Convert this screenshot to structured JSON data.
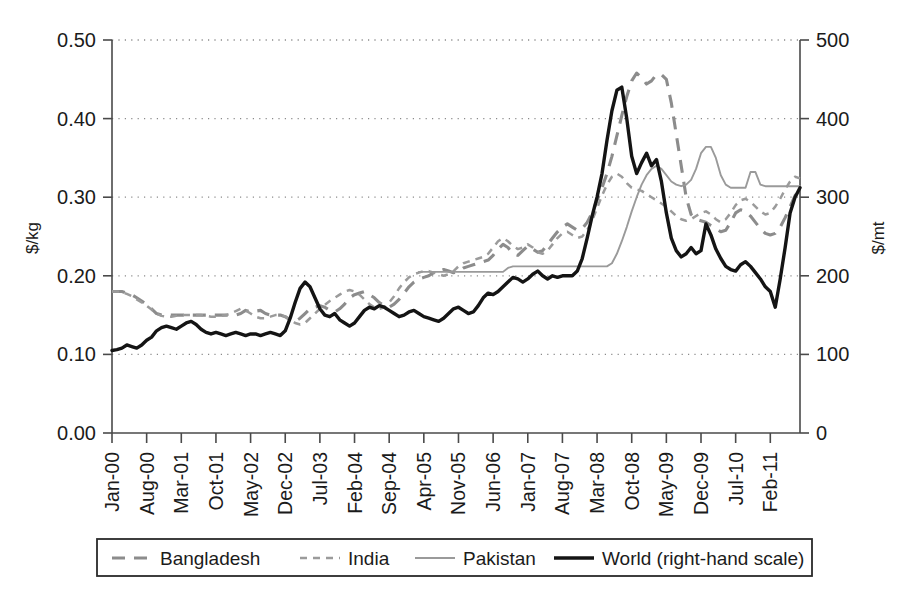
{
  "chart_data": {
    "type": "line",
    "title": "",
    "xlabel": "",
    "ylabel": "$/kg",
    "ylabel_right": "$/mt",
    "ylim": [
      0.0,
      0.5
    ],
    "ylim_right": [
      0,
      500
    ],
    "ytick_labels": [
      "0.50",
      "0.40",
      "0.30",
      "0.20",
      "0.10",
      "0.00"
    ],
    "ytick_values": [
      0.5,
      0.4,
      0.3,
      0.2,
      0.1,
      0.0
    ],
    "ytick_labels_right": [
      "500",
      "400",
      "300",
      "200",
      "100",
      "0"
    ],
    "ytick_values_right": [
      500,
      400,
      300,
      200,
      100,
      0
    ],
    "grid": "horizontal-dotted",
    "legend_position": "below-axes",
    "xtick_labels": [
      "Jan-00",
      "Aug-00",
      "Mar-01",
      "Oct-01",
      "May-02",
      "Dec-02",
      "Jul-03",
      "Feb-04",
      "Sep-04",
      "Apr-05",
      "Nov-05",
      "Jun-06",
      "Jan-07",
      "Aug-07",
      "Mar-08",
      "Oct-08",
      "May-09",
      "Dec-09",
      "Jul-10",
      "Feb-11"
    ],
    "xtick_index": [
      0,
      7,
      14,
      21,
      28,
      35,
      42,
      49,
      56,
      63,
      70,
      77,
      84,
      91,
      98,
      105,
      112,
      119,
      126,
      133
    ],
    "x_start": "Jan-00",
    "x_end": "Aug-11",
    "n_points": 140,
    "series": [
      {
        "name": "Bangladesh",
        "style": "long-dashed",
        "color": "#8c8c8c",
        "axis": "left",
        "unit": "$/kg",
        "start_index": 0,
        "values": [
          0.18,
          0.18,
          0.18,
          0.178,
          0.176,
          0.172,
          0.168,
          0.163,
          0.158,
          0.152,
          0.15,
          0.15,
          0.15,
          0.15,
          0.15,
          0.15,
          0.15,
          0.15,
          0.15,
          0.15,
          0.15,
          0.15,
          0.15,
          0.15,
          0.15,
          0.15,
          0.152,
          0.156,
          0.154,
          0.155,
          0.156,
          0.152,
          0.15,
          0.15,
          0.15,
          0.148,
          0.144,
          0.142,
          0.146,
          0.152,
          0.158,
          0.16,
          0.162,
          0.16,
          0.156,
          0.154,
          0.158,
          0.164,
          0.172,
          0.176,
          0.178,
          0.18,
          0.176,
          0.172,
          0.166,
          0.162,
          0.16,
          0.164,
          0.17,
          0.178,
          0.186,
          0.192,
          0.196,
          0.198,
          0.2,
          0.204,
          0.206,
          0.208,
          0.206,
          0.204,
          0.206,
          0.21,
          0.212,
          0.214,
          0.216,
          0.218,
          0.22,
          0.226,
          0.234,
          0.24,
          0.236,
          0.228,
          0.226,
          0.232,
          0.238,
          0.234,
          0.23,
          0.232,
          0.24,
          0.248,
          0.256,
          0.262,
          0.266,
          0.262,
          0.258,
          0.26,
          0.268,
          0.28,
          0.296,
          0.312,
          0.33,
          0.352,
          0.378,
          0.404,
          0.428,
          0.448,
          0.458,
          0.452,
          0.444,
          0.448,
          0.456,
          0.456,
          0.45,
          0.42,
          0.38,
          0.34,
          0.3,
          0.278,
          0.272,
          0.27,
          0.268,
          0.264,
          0.26,
          0.256,
          0.258,
          0.268,
          0.28,
          0.284,
          0.282,
          0.276,
          0.268,
          0.26,
          0.254,
          0.252,
          0.254,
          0.262,
          0.274,
          0.288,
          0.302,
          0.312,
          0.31,
          0.298,
          0.286,
          0.278
        ]
      },
      {
        "name": "India",
        "style": "short-dashed",
        "color": "#9b9b9b",
        "axis": "left",
        "unit": "$/kg",
        "start_index": 0,
        "values": [
          0.18,
          0.18,
          0.179,
          0.177,
          0.174,
          0.17,
          0.166,
          0.162,
          0.157,
          0.152,
          0.149,
          0.148,
          0.148,
          0.149,
          0.15,
          0.15,
          0.15,
          0.15,
          0.15,
          0.149,
          0.148,
          0.148,
          0.149,
          0.15,
          0.152,
          0.155,
          0.158,
          0.156,
          0.152,
          0.148,
          0.146,
          0.146,
          0.148,
          0.15,
          0.15,
          0.148,
          0.144,
          0.14,
          0.138,
          0.14,
          0.146,
          0.152,
          0.158,
          0.163,
          0.168,
          0.172,
          0.176,
          0.18,
          0.182,
          0.18,
          0.176,
          0.17,
          0.164,
          0.16,
          0.158,
          0.16,
          0.166,
          0.174,
          0.184,
          0.192,
          0.198,
          0.202,
          0.204,
          0.206,
          0.206,
          0.204,
          0.202,
          0.2,
          0.202,
          0.206,
          0.212,
          0.216,
          0.218,
          0.22,
          0.222,
          0.224,
          0.228,
          0.236,
          0.244,
          0.248,
          0.244,
          0.238,
          0.234,
          0.236,
          0.24,
          0.236,
          0.23,
          0.228,
          0.232,
          0.24,
          0.248,
          0.254,
          0.256,
          0.252,
          0.248,
          0.25,
          0.258,
          0.27,
          0.286,
          0.302,
          0.316,
          0.326,
          0.33,
          0.326,
          0.318,
          0.312,
          0.31,
          0.308,
          0.304,
          0.3,
          0.296,
          0.292,
          0.288,
          0.282,
          0.276,
          0.272,
          0.27,
          0.272,
          0.276,
          0.28,
          0.282,
          0.278,
          0.272,
          0.268,
          0.272,
          0.28,
          0.29,
          0.296,
          0.298,
          0.294,
          0.288,
          0.282,
          0.278,
          0.28,
          0.288,
          0.298,
          0.31,
          0.32,
          0.326,
          0.324,
          0.316,
          0.304,
          0.292,
          0.282
        ]
      },
      {
        "name": "Pakistan",
        "style": "thin-solid",
        "color": "#9a9a9a",
        "axis": "left",
        "unit": "$/kg",
        "start_index": 62,
        "values": [
          0.205,
          0.205,
          0.205,
          0.205,
          0.205,
          0.205,
          0.205,
          0.205,
          0.205,
          0.205,
          0.205,
          0.205,
          0.205,
          0.205,
          0.205,
          0.205,
          0.205,
          0.205,
          0.21,
          0.212,
          0.212,
          0.212,
          0.212,
          0.212,
          0.212,
          0.212,
          0.212,
          0.212,
          0.212,
          0.212,
          0.212,
          0.212,
          0.212,
          0.212,
          0.212,
          0.212,
          0.212,
          0.212,
          0.212,
          0.216,
          0.228,
          0.244,
          0.262,
          0.282,
          0.3,
          0.316,
          0.328,
          0.336,
          0.34,
          0.336,
          0.328,
          0.32,
          0.316,
          0.314,
          0.316,
          0.322,
          0.336,
          0.356,
          0.364,
          0.364,
          0.35,
          0.328,
          0.316,
          0.312,
          0.312,
          0.312,
          0.312,
          0.332,
          0.332,
          0.316,
          0.314,
          0.314,
          0.314,
          0.314,
          0.314,
          0.314,
          0.314,
          0.314,
          0.314,
          0.314,
          0.314,
          0.314,
          0.3,
          0.298,
          0.298,
          0.298,
          0.298,
          0.298,
          0.298,
          0.298,
          0.306,
          0.312,
          0.312,
          0.316,
          0.322,
          0.33,
          0.336,
          0.332,
          0.322,
          0.312
        ]
      },
      {
        "name": "World (right-hand scale)",
        "style": "thick-solid",
        "color": "#141414",
        "axis": "right",
        "unit": "$/mt",
        "start_index": 0,
        "values": [
          105,
          106,
          108,
          112,
          110,
          108,
          112,
          118,
          122,
          130,
          134,
          136,
          134,
          132,
          136,
          140,
          142,
          138,
          132,
          128,
          126,
          128,
          126,
          124,
          126,
          128,
          126,
          124,
          126,
          126,
          124,
          126,
          128,
          126,
          124,
          130,
          146,
          166,
          184,
          192,
          186,
          172,
          158,
          150,
          148,
          152,
          144,
          140,
          136,
          140,
          148,
          156,
          160,
          158,
          162,
          160,
          156,
          152,
          148,
          150,
          154,
          156,
          152,
          148,
          146,
          144,
          142,
          146,
          152,
          158,
          160,
          156,
          152,
          154,
          162,
          172,
          178,
          176,
          180,
          186,
          192,
          198,
          196,
          192,
          196,
          202,
          206,
          200,
          196,
          200,
          198,
          200,
          200,
          200,
          206,
          222,
          248,
          276,
          300,
          330,
          372,
          410,
          436,
          440,
          400,
          352,
          330,
          344,
          356,
          340,
          348,
          320,
          280,
          248,
          232,
          224,
          228,
          236,
          228,
          232,
          266,
          252,
          234,
          222,
          212,
          208,
          206,
          214,
          218,
          212,
          204,
          196,
          186,
          180,
          160,
          196,
          236,
          280,
          300,
          312,
          322,
          342,
          352,
          320,
          336,
          332
        ]
      }
    ]
  },
  "legend": {
    "items": [
      {
        "label": "Bangladesh",
        "key": "bangladesh"
      },
      {
        "label": "India",
        "key": "india"
      },
      {
        "label": "Pakistan",
        "key": "pakistan"
      },
      {
        "label": "World (right-hand scale)",
        "key": "world"
      }
    ]
  },
  "colors": {
    "bangladesh": "#8c8c8c",
    "india": "#9b9b9b",
    "pakistan": "#9a9a9a",
    "world": "#141414",
    "axis": "#4a4a4a",
    "grid": "#8a8a8a",
    "background": "#ffffff"
  }
}
